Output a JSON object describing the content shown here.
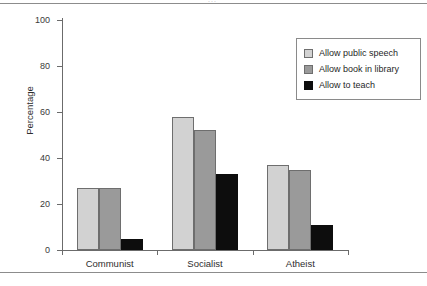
{
  "chart_data": {
    "type": "bar",
    "title": "",
    "subtitle": "",
    "xlabel": "",
    "ylabel": "Percentage",
    "categories": [
      "Communist",
      "Socialist",
      "Atheist"
    ],
    "series": [
      {
        "name": "Allow public speech",
        "values": [
          27,
          58,
          37
        ],
        "color": "#d2d2d2"
      },
      {
        "name": "Allow book in library",
        "values": [
          27,
          52,
          35
        ],
        "color": "#9a9a9a"
      },
      {
        "name": "Allow to teach",
        "values": [
          5,
          33,
          11
        ],
        "color": "#0d0d0d"
      }
    ],
    "ylim": [
      0,
      100
    ],
    "yticks": [
      0,
      20,
      40,
      60,
      80,
      100
    ],
    "ytick_labels": [
      "0",
      "20",
      "40",
      "60",
      "80",
      "100"
    ],
    "grid": false,
    "legend_position": "top-right",
    "annotations": []
  },
  "figure": {
    "clipped_header_text": "...",
    "background_color": "#ffffff",
    "axis_color": "#6b6b6b",
    "rule_color": "#8c8c8c"
  }
}
